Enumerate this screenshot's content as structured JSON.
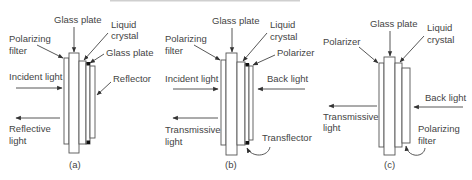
{
  "figure": {
    "type": "LCD display mode schematic",
    "colors": {
      "stroke": "#555555",
      "text": "#444444",
      "background": "#ffffff",
      "marker": "#111111"
    }
  },
  "panels": [
    {
      "id": "a",
      "caption": "(a)",
      "labels": {
        "glass_plate_top": "Glass plate",
        "liquid_crystal_1": "Liquid",
        "liquid_crystal_2": "crystal",
        "left_layer_1": "Polarizing",
        "left_layer_2": "filter",
        "right_glass": "Glass plate",
        "right_layer": "Reflector",
        "incoming": "Incident light",
        "outgoing_1": "Reflective",
        "outgoing_2": "light"
      }
    },
    {
      "id": "b",
      "caption": "(b)",
      "labels": {
        "glass_plate_top": "Glass plate",
        "liquid_crystal_1": "Liquid",
        "liquid_crystal_2": "crystal",
        "left_layer_1": "Polarizing",
        "left_layer_2": "filter",
        "right_layer": "Polarizer",
        "incoming": "Incident light",
        "back": "Back light",
        "outgoing_1": "Transmissive",
        "outgoing_2": "light",
        "bottom_callout": "Transflector"
      }
    },
    {
      "id": "c",
      "caption": "(c)",
      "labels": {
        "glass_plate_top": "Glass plate",
        "liquid_crystal_1": "Liquid",
        "liquid_crystal_2": "crystal",
        "left_layer": "Polarizer",
        "back": "Back light",
        "outgoing_1": "Transmissive",
        "outgoing_2": "light",
        "bottom_callout_1": "Polarizing",
        "bottom_callout_2": "filter"
      }
    }
  ]
}
